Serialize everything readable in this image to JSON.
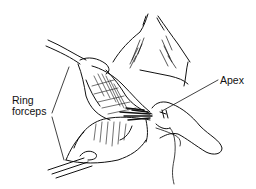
{
  "figure": {
    "type": "surgical line illustration",
    "background": "#ffffff",
    "ink": "#111111"
  },
  "labels": {
    "ring_forceps_line1": "Ring",
    "ring_forceps_line2": "forceps",
    "apex": "Apex"
  }
}
